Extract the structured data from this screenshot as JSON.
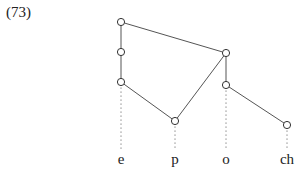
{
  "example": {
    "number": "(73)"
  },
  "diagram": {
    "type": "feature-geometry-tree",
    "line_color": "#555555",
    "nodes": [
      {
        "id": "n1",
        "x": 121,
        "y": 22
      },
      {
        "id": "n2",
        "x": 121,
        "y": 52
      },
      {
        "id": "n3",
        "x": 121,
        "y": 82
      },
      {
        "id": "n4",
        "x": 226,
        "y": 53
      },
      {
        "id": "n5",
        "x": 226,
        "y": 85
      },
      {
        "id": "n6",
        "x": 175,
        "y": 121
      },
      {
        "id": "n7",
        "x": 287,
        "y": 125
      }
    ],
    "edges": [
      [
        "n1",
        "n2"
      ],
      [
        "n2",
        "n3"
      ],
      [
        "n1",
        "n4"
      ],
      [
        "n3",
        "n6"
      ],
      [
        "n4",
        "n6"
      ],
      [
        "n4",
        "n5"
      ],
      [
        "n5",
        "n7"
      ]
    ],
    "segments": [
      {
        "label": "e",
        "x": 121,
        "anchor_node": "n3"
      },
      {
        "label": "p",
        "x": 175,
        "anchor_node": "n6"
      },
      {
        "label": "o",
        "x": 226,
        "anchor_node": "n5"
      },
      {
        "label": "ch",
        "x": 287,
        "anchor_node": "n7"
      }
    ]
  }
}
